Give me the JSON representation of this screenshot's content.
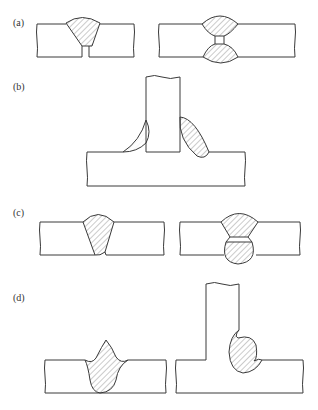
{
  "figure": {
    "panels": [
      {
        "id": "a",
        "label": "(a)",
        "description": "Butt joints: single-V weld with root gap; double-sided weld with root gap"
      },
      {
        "id": "b",
        "label": "(b)",
        "description": "T-joint with thin fillet on left and convex fillet on right"
      },
      {
        "id": "c",
        "label": "(c)",
        "description": "Butt joints: single-V weld with incomplete root; double-V weld with lack of fusion at root"
      },
      {
        "id": "d",
        "label": "(d)",
        "description": "Butt weld with excessive reinforcement and undercut; T-joint fillet with overlap"
      }
    ],
    "colors": {
      "line": "#3a3a3a",
      "hatch": "#6a6a6a",
      "background": "#ffffff"
    },
    "caption": "(partially cut off at bottom edge)"
  }
}
